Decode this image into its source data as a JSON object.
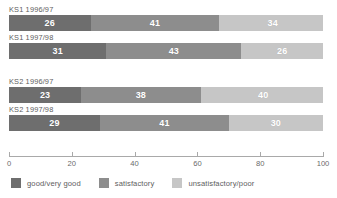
{
  "chart_data": {
    "type": "bar",
    "orientation": "horizontal",
    "stacked": true,
    "stacked_percent": true,
    "title": "",
    "xlabel": "",
    "ylabel": "",
    "xlim": [
      0,
      100
    ],
    "grid": false,
    "legend_position": "bottom",
    "categories": [
      "KS1 1996/97",
      "KS1 1997/98",
      "KS2 1996/97",
      "KS2 1997/98"
    ],
    "series": [
      {
        "name": "good/very good",
        "color": "#6e6e6e",
        "values": [
          26,
          31,
          23,
          29
        ]
      },
      {
        "name": "satisfactory",
        "color": "#8d8d8d",
        "values": [
          41,
          43,
          38,
          41
        ]
      },
      {
        "name": "unsatisfactory/poor",
        "color": "#c6c6c6",
        "values": [
          34,
          26,
          40,
          30
        ]
      }
    ],
    "xticks": [
      0,
      20,
      40,
      60,
      80,
      100
    ],
    "xtick_labels": [
      "0",
      "20",
      "40",
      "60",
      "80",
      "100"
    ]
  },
  "bars": [
    {
      "label": "KS1 1996/97",
      "segments": [
        {
          "key": "good",
          "value": 26,
          "value_label": "26"
        },
        {
          "key": "sat",
          "value": 41,
          "value_label": "41"
        },
        {
          "key": "uns",
          "value": 34,
          "value_label": "34"
        }
      ]
    },
    {
      "label": "KS1 1997/98",
      "segments": [
        {
          "key": "good",
          "value": 31,
          "value_label": "31"
        },
        {
          "key": "sat",
          "value": 43,
          "value_label": "43"
        },
        {
          "key": "uns",
          "value": 26,
          "value_label": "26"
        }
      ]
    },
    {
      "label": "KS2 1996/97",
      "segments": [
        {
          "key": "good",
          "value": 23,
          "value_label": "23"
        },
        {
          "key": "sat",
          "value": 38,
          "value_label": "38"
        },
        {
          "key": "uns",
          "value": 40,
          "value_label": "40"
        }
      ]
    },
    {
      "label": "KS2 1997/98",
      "segments": [
        {
          "key": "good",
          "value": 29,
          "value_label": "29"
        },
        {
          "key": "sat",
          "value": 41,
          "value_label": "41"
        },
        {
          "key": "uns",
          "value": 30,
          "value_label": "30"
        }
      ]
    }
  ],
  "axis": {
    "ticks": [
      "0",
      "20",
      "40",
      "60",
      "80",
      "100"
    ],
    "positions": [
      0,
      20,
      40,
      60,
      80,
      100
    ]
  },
  "legend": {
    "items": [
      {
        "label": "good/very good",
        "color": "#6e6e6e"
      },
      {
        "label": "satisfactory",
        "color": "#8d8d8d"
      },
      {
        "label": "unsatisfactory/poor",
        "color": "#c6c6c6"
      }
    ]
  },
  "colors": {
    "good": "#6e6e6e",
    "satisfactory": "#8d8d8d",
    "unsatisfactory": "#c6c6c6",
    "axis": "#a9a9a9",
    "text": "#5e5e5e",
    "background": "#ffffff"
  }
}
